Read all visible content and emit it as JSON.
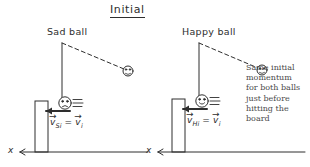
{
  "title": "Initial",
  "left_panel": {
    "ball_label": "Sad ball",
    "velocity_label": {
      "v_symbol": "v",
      "subscript_1": "Si",
      "equals": "=",
      "subscript_2": "i",
      "vector_arrow": "→",
      "full_text": "v⃗Si = v⃗i"
    },
    "axis_label": "x"
  },
  "right_panel": {
    "ball_label": "Happy ball",
    "velocity_label": {
      "v_symbol": "v",
      "subscript_1": "Hi",
      "equals": "=",
      "subscript_2": "i",
      "vector_arrow": "→",
      "full_text": "v⃗Hi = v⃗i"
    },
    "axis_label": "x"
  },
  "annotation": {
    "lines": [
      "Same initial",
      "momentum",
      "for both balls",
      "just before",
      "hitting the",
      "board"
    ]
  },
  "colors": {
    "ink": "#2e2e2e",
    "note_ink": "#4a4a4a",
    "paper": "#ffffff"
  }
}
